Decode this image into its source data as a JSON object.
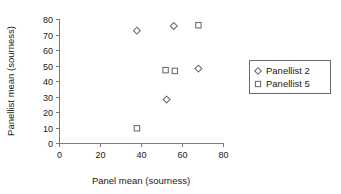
{
  "chart_data": {
    "type": "scatter",
    "title": "",
    "xlabel": "Panel mean (sourness)",
    "ylabel": "Panellist mean (sourness)",
    "xlim": [
      0,
      80
    ],
    "ylim": [
      0,
      80
    ],
    "xticks": [
      0,
      20,
      40,
      60,
      80
    ],
    "yticks": [
      0,
      10,
      20,
      30,
      40,
      50,
      60,
      70,
      80
    ],
    "xtick_labels": [
      "0",
      "20",
      "40",
      "60",
      "80"
    ],
    "ytick_labels": [
      "0",
      "10",
      "20",
      "30",
      "40",
      "50",
      "60",
      "70",
      "80"
    ],
    "grid": false,
    "legend_position": "right",
    "series": [
      {
        "name": "Panellist 2",
        "marker": "diamond",
        "color": "#6e6e78",
        "points": [
          {
            "x": 38.0,
            "y": 72.5
          },
          {
            "x": 56.0,
            "y": 75.5
          },
          {
            "x": 52.5,
            "y": 28.0
          },
          {
            "x": 68.0,
            "y": 48.0
          }
        ]
      },
      {
        "name": "Panellist 5",
        "marker": "square",
        "color": "#6e6e78",
        "points": [
          {
            "x": 68.0,
            "y": 76.0
          },
          {
            "x": 52.0,
            "y": 47.0
          },
          {
            "x": 56.5,
            "y": 46.5
          },
          {
            "x": 38.0,
            "y": 9.5
          }
        ]
      }
    ]
  },
  "legend": {
    "entries": [
      {
        "label": "Panellist 2",
        "marker": "diamond-marker-icon"
      },
      {
        "label": "Panellist 5",
        "marker": "square-marker-icon"
      }
    ]
  },
  "axes": {
    "x_title": "Panel mean (sourness)",
    "y_title": "Panellist mean (sourness)"
  }
}
